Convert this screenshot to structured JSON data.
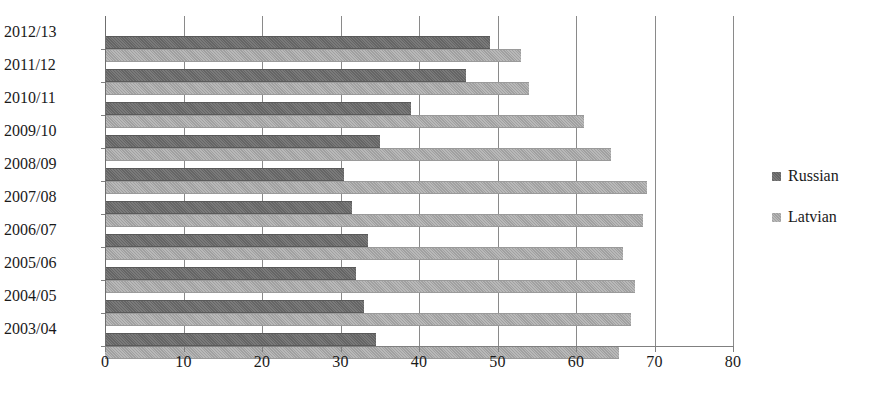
{
  "chart_data": {
    "type": "bar",
    "orientation": "horizontal",
    "title": "",
    "xlabel": "",
    "ylabel": "",
    "xlim": [
      0,
      80
    ],
    "xticks": [
      0,
      10,
      20,
      30,
      40,
      50,
      60,
      70,
      80
    ],
    "xtick_labels": [
      "0",
      "10",
      "20",
      "30",
      "40",
      "50",
      "60",
      "70",
      "80"
    ],
    "grid": true,
    "grid_axis": "x",
    "legend_position": "right",
    "categories": [
      "2012/13",
      "2011/12",
      "2010/11",
      "2009/10",
      "2008/09",
      "2007/08",
      "2006/07",
      "2005/06",
      "2004/05",
      "2003/04"
    ],
    "series": [
      {
        "name": "Russian",
        "color": "#6b6b6b",
        "values": [
          49,
          46,
          39,
          35,
          30.5,
          31.5,
          33.5,
          32,
          33,
          34.5
        ]
      },
      {
        "name": "Latvian",
        "color": "#a9a9a9",
        "values": [
          53,
          54,
          61,
          64.5,
          69,
          68.5,
          66,
          67.5,
          67,
          65.5
        ]
      }
    ]
  },
  "legend": {
    "items": [
      {
        "label": "Russian",
        "swatch": "russian"
      },
      {
        "label": "Latvian",
        "swatch": "latvian"
      }
    ]
  }
}
